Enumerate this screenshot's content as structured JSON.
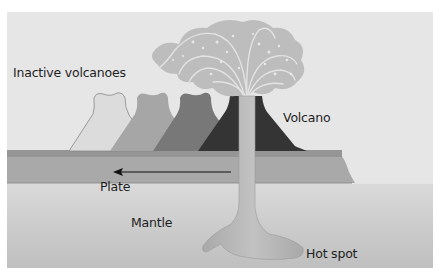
{
  "diagram": {
    "labels": {
      "inactive_volcanoes": "Inactive volcanoes",
      "volcano": "Volcano",
      "plate": "Plate",
      "mantle": "Mantle",
      "hot_spot": "Hot spot"
    },
    "arrow": {
      "direction": "left",
      "meaning": "plate motion"
    },
    "colors": {
      "sky": "#e6e6e6",
      "plate_top": "#9a9a9a",
      "plate": "#a8a8a8",
      "mantle_top": "#d8d8d8",
      "mantle_bottom": "#c4c4c4",
      "inactive_volcano_1": "#dcdcdc",
      "inactive_volcano_2": "#a6a6a6",
      "inactive_volcano_3": "#777777",
      "active_volcano": "#343434",
      "plume": "#b8b8b8",
      "eruption_cloud": "#bdbdbd"
    }
  }
}
